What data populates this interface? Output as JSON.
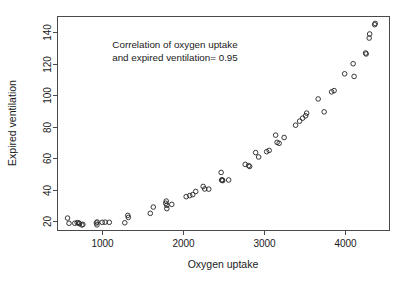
{
  "chart_data": {
    "type": "scatter",
    "title": "",
    "xlabel": "Oxygen uptake",
    "ylabel": "Expired ventilation",
    "xlim": [
      450,
      4550
    ],
    "ylim": [
      14,
      150
    ],
    "xticks": [
      1000,
      2000,
      3000,
      4000
    ],
    "yticks": [
      20,
      40,
      60,
      80,
      100,
      120,
      140
    ],
    "xtick_labels": [
      "1000",
      "2000",
      "3000",
      "4000"
    ],
    "ytick_labels": [
      "20",
      "40",
      "60",
      "80",
      "100",
      "120",
      "140"
    ],
    "grid": false,
    "legend": null,
    "marker": "open-circle",
    "annotations": [
      {
        "name": "correlation-note",
        "line1": "Correlation of oxygen uptake",
        "line2": "and expired ventilation=  0.95",
        "x": 1750,
        "y": 131
      }
    ],
    "correlation": 0.95,
    "series": [
      {
        "name": "observations",
        "points": [
          [
            574,
            21.9
          ],
          [
            592,
            18.6
          ],
          [
            664,
            18.6
          ],
          [
            694,
            19.0
          ],
          [
            713,
            18.8
          ],
          [
            722,
            18.3
          ],
          [
            752,
            17.5
          ],
          [
            763,
            17.9
          ],
          [
            930,
            18.8
          ],
          [
            937,
            17.6
          ],
          [
            940,
            19.4
          ],
          [
            1002,
            19.2
          ],
          [
            1038,
            19.3
          ],
          [
            1090,
            19.2
          ],
          [
            1281,
            18.9
          ],
          [
            1318,
            23.6
          ],
          [
            1325,
            22.3
          ],
          [
            1596,
            24.9
          ],
          [
            1633,
            28.9
          ],
          [
            1787,
            31.3
          ],
          [
            1793,
            32.7
          ],
          [
            1799,
            30.0
          ],
          [
            1800,
            27.9
          ],
          [
            1861,
            30.6
          ],
          [
            2039,
            35.5
          ],
          [
            2083,
            36.2
          ],
          [
            2120,
            36.8
          ],
          [
            2157,
            38.8
          ],
          [
            2249,
            42.0
          ],
          [
            2268,
            40.4
          ],
          [
            2318,
            40.3
          ],
          [
            2471,
            50.9
          ],
          [
            2477,
            46.0
          ],
          [
            2484,
            46.2
          ],
          [
            2490,
            45.7
          ],
          [
            2564,
            46.1
          ],
          [
            2768,
            56.0
          ],
          [
            2811,
            55.2
          ],
          [
            2823,
            54.7
          ],
          [
            2897,
            63.5
          ],
          [
            2934,
            60.7
          ],
          [
            3033,
            64.1
          ],
          [
            3064,
            64.9
          ],
          [
            3144,
            74.6
          ],
          [
            3162,
            70.0
          ],
          [
            3187,
            69.4
          ],
          [
            3249,
            73.1
          ],
          [
            3390,
            80.9
          ],
          [
            3440,
            83.5
          ],
          [
            3477,
            85.4
          ],
          [
            3514,
            86.9
          ],
          [
            3527,
            88.6
          ],
          [
            3669,
            97.6
          ],
          [
            3743,
            89.4
          ],
          [
            3835,
            102.1
          ],
          [
            3866,
            102.9
          ],
          [
            3996,
            113.6
          ],
          [
            4101,
            120.0
          ],
          [
            4113,
            111.9
          ],
          [
            4255,
            126.8
          ],
          [
            4262,
            126.2
          ],
          [
            4299,
            136.3
          ],
          [
            4305,
            138.9
          ],
          [
            4367,
            144.8
          ],
          [
            4373,
            145.6
          ]
        ]
      }
    ]
  },
  "figure": {
    "background_color": "#ffffff",
    "axis_color": "#4a4a4a",
    "marker_color": "#222222",
    "text_color": "#1a1a1a"
  }
}
